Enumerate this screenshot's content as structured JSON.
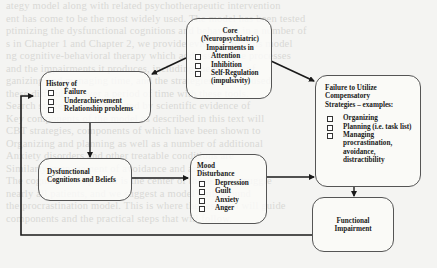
{
  "diagram": {
    "core": {
      "title_lines": [
        "Core",
        "(Neuropsychiatric)",
        "Impairments in"
      ],
      "items": [
        "Attention",
        "Inhibition",
        "Self-Regulation (impulsivity)"
      ]
    },
    "history": {
      "title": "History of",
      "items": [
        "Failure",
        "Underachievement",
        "Relationship problems"
      ]
    },
    "failure_to_utilize": {
      "title_lines": [
        "Failure to Utilize",
        "Compensatory",
        "Strategies – examples:"
      ],
      "items": [
        "Organizing",
        "Planning (i.e. task list)",
        "Managing procrastination, avoidance, distractibility"
      ]
    },
    "dysfunctional": {
      "title_lines": [
        "Dysfunctional",
        "Cognitions and Beliefs"
      ]
    },
    "mood": {
      "title_lines": [
        "Mood",
        "Disturbance"
      ],
      "items": [
        "Depression",
        "Guilt",
        "Anxiety",
        "Anger"
      ]
    },
    "functional": {
      "title_lines": [
        "Functional",
        "Impairment"
      ]
    },
    "edges": [
      {
        "from": "core",
        "to": "history"
      },
      {
        "from": "core",
        "to": "failure_to_utilize"
      },
      {
        "from": "history",
        "to": "dysfunctional"
      },
      {
        "from": "dysfunctional",
        "to": "mood"
      },
      {
        "from": "mood",
        "to": "failure_to_utilize"
      },
      {
        "from": "failure_to_utilize",
        "to": "functional"
      },
      {
        "from": "functional",
        "to": "history"
      }
    ],
    "colors": {
      "line": "#1a1a1a",
      "box_border": "#555555",
      "background": "#f4f4f2"
    }
  },
  "bleed_through_text": [
    "ategy model along with related psychotherapeutic intervention",
    "ent has come to be the most widely used. The model has been tested",
    "ptimizing the dysfunctional cognitions and behaviors in a number of",
    "s in Chapter 1 and Chapter 2, we provide evidence for this model",
    "ng cognitive-behavioral therapy which addresses these processes",
    "and the impairments it produces, including the variety of",
    "ganizing and managing time, and the strategies that are used",
    "these difficulties over a period of time with these tools.",
    "Search strategies are indicated by scientific evidence of",
    "Key components of the model as described in this text will",
    "CBT strategies, components of which have been shown to",
    "Organizing and planning as well as a number of additional",
    "Anxiety disorders and other treatable conditions are",
    "Similarly, management of avoidance and anger.",
    "The cognitive component is the center of those who struggle",
    "nearly all patients, and we suggest a model built around",
    "the procrastination model. This is where the research will guide",
    "components and the practical steps that will follow."
  ]
}
